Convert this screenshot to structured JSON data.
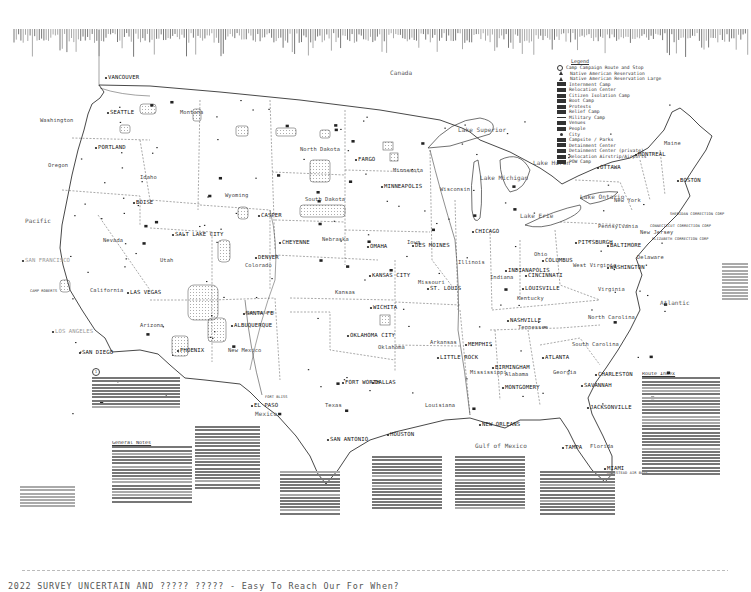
{
  "map": {
    "regions": {
      "canada": "Canada",
      "mexico": "Mexico",
      "pacific": "Pacific",
      "atlantic": "Atlantic",
      "gulf": "Gulf of Mexico",
      "lake_superior": "Lake Superior",
      "lake_michigan": "Lake Michigan",
      "lake_huron": "Lake Huron",
      "lake_erie": "Lake Erie",
      "lake_ontario": "Lake Ontario"
    },
    "states": [
      {
        "name": "Washington",
        "x": 40,
        "y": 118
      },
      {
        "name": "Oregon",
        "x": 48,
        "y": 163
      },
      {
        "name": "California",
        "x": 90,
        "y": 288
      },
      {
        "name": "Idaho",
        "x": 140,
        "y": 175
      },
      {
        "name": "Nevada",
        "x": 103,
        "y": 238
      },
      {
        "name": "Utah",
        "x": 160,
        "y": 258
      },
      {
        "name": "Arizona",
        "x": 140,
        "y": 323
      },
      {
        "name": "Montana",
        "x": 180,
        "y": 110
      },
      {
        "name": "Wyoming",
        "x": 225,
        "y": 193
      },
      {
        "name": "Colorado",
        "x": 245,
        "y": 263
      },
      {
        "name": "New Mexico",
        "x": 228,
        "y": 348
      },
      {
        "name": "North Dakota",
        "x": 300,
        "y": 147
      },
      {
        "name": "South Dakota",
        "x": 305,
        "y": 197
      },
      {
        "name": "Nebraska",
        "x": 322,
        "y": 237
      },
      {
        "name": "Kansas",
        "x": 335,
        "y": 290
      },
      {
        "name": "Oklahoma",
        "x": 378,
        "y": 345
      },
      {
        "name": "Texas",
        "x": 325,
        "y": 403
      },
      {
        "name": "Minnesota",
        "x": 393,
        "y": 168
      },
      {
        "name": "Iowa",
        "x": 407,
        "y": 240
      },
      {
        "name": "Missouri",
        "x": 418,
        "y": 280
      },
      {
        "name": "Arkansas",
        "x": 430,
        "y": 340
      },
      {
        "name": "Louisiana",
        "x": 425,
        "y": 403
      },
      {
        "name": "Wisconsin",
        "x": 440,
        "y": 187
      },
      {
        "name": "Illinois",
        "x": 458,
        "y": 260
      },
      {
        "name": "Indiana",
        "x": 490,
        "y": 275
      },
      {
        "name": "Ohio",
        "x": 534,
        "y": 252
      },
      {
        "name": "Kentucky",
        "x": 517,
        "y": 296
      },
      {
        "name": "Tennessee",
        "x": 518,
        "y": 325
      },
      {
        "name": "Mississippi",
        "x": 470,
        "y": 370
      },
      {
        "name": "Alabama",
        "x": 505,
        "y": 372
      },
      {
        "name": "Georgia",
        "x": 553,
        "y": 370
      },
      {
        "name": "Florida",
        "x": 590,
        "y": 444
      },
      {
        "name": "South Carolina",
        "x": 572,
        "y": 342
      },
      {
        "name": "North Carolina",
        "x": 588,
        "y": 315
      },
      {
        "name": "Virginia",
        "x": 598,
        "y": 287
      },
      {
        "name": "West Virginia",
        "x": 573,
        "y": 263
      },
      {
        "name": "Pennsylvania",
        "x": 598,
        "y": 224
      },
      {
        "name": "New York",
        "x": 614,
        "y": 198
      },
      {
        "name": "Maine",
        "x": 664,
        "y": 141
      },
      {
        "name": "Delaware",
        "x": 637,
        "y": 255
      },
      {
        "name": "New Jersey",
        "x": 640,
        "y": 230
      }
    ],
    "cities": [
      {
        "name": "VANCOUVER",
        "x": 108,
        "y": 75
      },
      {
        "name": "SEATTLE",
        "x": 110,
        "y": 110
      },
      {
        "name": "PORTLAND",
        "x": 98,
        "y": 145
      },
      {
        "name": "SAN FRANCISCO",
        "x": 25,
        "y": 258,
        "faint": true
      },
      {
        "name": "LAS VEGAS",
        "x": 130,
        "y": 290
      },
      {
        "name": "LOS ANGELES",
        "x": 55,
        "y": 329,
        "faint": true
      },
      {
        "name": "SAN DIEGO",
        "x": 82,
        "y": 350
      },
      {
        "name": "PHOENIX",
        "x": 180,
        "y": 348
      },
      {
        "name": "SALT LAKE CITY",
        "x": 175,
        "y": 232
      },
      {
        "name": "BOISE",
        "x": 136,
        "y": 200
      },
      {
        "name": "CASPER",
        "x": 261,
        "y": 213
      },
      {
        "name": "CHEYENNE",
        "x": 282,
        "y": 240
      },
      {
        "name": "DENVER",
        "x": 258,
        "y": 255
      },
      {
        "name": "SANTA FE",
        "x": 246,
        "y": 311
      },
      {
        "name": "ALBUQUERQUE",
        "x": 234,
        "y": 323
      },
      {
        "name": "EL PASO",
        "x": 254,
        "y": 403
      },
      {
        "name": "FARGO",
        "x": 358,
        "y": 157
      },
      {
        "name": "MINNEAPOLIS",
        "x": 384,
        "y": 184
      },
      {
        "name": "OMAHA",
        "x": 370,
        "y": 244
      },
      {
        "name": "KANSAS CITY",
        "x": 372,
        "y": 273
      },
      {
        "name": "WICHITA",
        "x": 373,
        "y": 305
      },
      {
        "name": "OKLAHOMA CITY",
        "x": 350,
        "y": 333
      },
      {
        "name": "FORT WORTH",
        "x": 345,
        "y": 380
      },
      {
        "name": "DALLAS",
        "x": 375,
        "y": 380
      },
      {
        "name": "SAN ANTONIO",
        "x": 330,
        "y": 437
      },
      {
        "name": "HOUSTON",
        "x": 390,
        "y": 432
      },
      {
        "name": "NEW ORLEANS",
        "x": 482,
        "y": 422
      },
      {
        "name": "DES MOINES",
        "x": 415,
        "y": 243
      },
      {
        "name": "ST. LOUIS",
        "x": 430,
        "y": 286
      },
      {
        "name": "LITTLE ROCK",
        "x": 440,
        "y": 355
      },
      {
        "name": "MEMPHIS",
        "x": 468,
        "y": 342
      },
      {
        "name": "CHICAGO",
        "x": 475,
        "y": 229
      },
      {
        "name": "INDIANAPOLIS",
        "x": 508,
        "y": 268
      },
      {
        "name": "CINCINNATI",
        "x": 528,
        "y": 273
      },
      {
        "name": "LOUISVILLE",
        "x": 525,
        "y": 286
      },
      {
        "name": "NASHVILLE",
        "x": 510,
        "y": 318
      },
      {
        "name": "BIRMINGHAM",
        "x": 495,
        "y": 365
      },
      {
        "name": "MONTGOMERY",
        "x": 505,
        "y": 385
      },
      {
        "name": "ATLANTA",
        "x": 545,
        "y": 355
      },
      {
        "name": "COLUMBUS",
        "x": 545,
        "y": 258
      },
      {
        "name": "PITTSBURGH",
        "x": 578,
        "y": 240
      },
      {
        "name": "BALTIMORE",
        "x": 610,
        "y": 243
      },
      {
        "name": "WASHINGTON",
        "x": 610,
        "y": 265
      },
      {
        "name": "CHARLESTON",
        "x": 598,
        "y": 372
      },
      {
        "name": "SAVANNAH",
        "x": 584,
        "y": 383
      },
      {
        "name": "JACKSONVILLE",
        "x": 590,
        "y": 405
      },
      {
        "name": "TAMPA",
        "x": 565,
        "y": 445
      },
      {
        "name": "MIAMI",
        "x": 607,
        "y": 466
      },
      {
        "name": "BOSTON",
        "x": 680,
        "y": 178
      },
      {
        "name": "MONTREAL",
        "x": 638,
        "y": 152
      },
      {
        "name": "OTTAWA",
        "x": 600,
        "y": 165
      }
    ],
    "sites": [
      {
        "name": "CONNECTICUT CORRECTION CORP",
        "x": 650,
        "y": 225
      },
      {
        "name": "ELIZABETH CORRECTION CORP",
        "x": 652,
        "y": 238
      },
      {
        "name": "SHERIDAN CORRECTION CORP",
        "x": 670,
        "y": 213
      },
      {
        "name": "CAMP ROBERTS",
        "x": 30,
        "y": 290
      },
      {
        "name": "CAMP SANTA FE",
        "x": 245,
        "y": 312
      },
      {
        "name": "FORT BLISS",
        "x": 265,
        "y": 396
      },
      {
        "name": "HOMESTEAD AIR BASE",
        "x": 607,
        "y": 472
      }
    ]
  },
  "legend": {
    "title": "Legend",
    "items": [
      {
        "label": "Camp Campaign Route and Stop",
        "sym": "o"
      },
      {
        "label": "Native American Reservation",
        "sym": "tri"
      },
      {
        "label": "Native American Reservation Large",
        "sym": "tri"
      },
      {
        "label": "Internment Camp",
        "sym": "box"
      },
      {
        "label": "Relocation Center",
        "sym": "box"
      },
      {
        "label": "Citizen Isolation Camp",
        "sym": "box"
      },
      {
        "label": "Boot Camp",
        "sym": "box"
      },
      {
        "label": "Protests",
        "sym": "box"
      },
      {
        "label": "Relief Camp",
        "sym": "box"
      },
      {
        "label": "Military Camp",
        "sym": "line"
      },
      {
        "label": "Venues",
        "sym": "box"
      },
      {
        "label": "People",
        "sym": "box"
      },
      {
        "label": "City",
        "sym": "dot"
      },
      {
        "label": "Campsite / Parks",
        "sym": "box"
      },
      {
        "label": "Detainment Center",
        "sym": "box"
      },
      {
        "label": "Detainment Center (private)",
        "sym": "box"
      },
      {
        "label": "Relocation Airstrip/Airports",
        "sym": "box"
      },
      {
        "label": "POW Camp",
        "sym": "box"
      }
    ]
  },
  "notes": {
    "general_title": "General Notes",
    "route_title": "Route Index"
  },
  "caption": {
    "text": "2022 SURVEY UNCERTAIN AND ????? ????? - Easy To Reach Our For When?"
  }
}
